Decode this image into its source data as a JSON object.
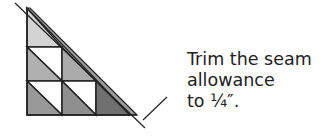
{
  "diagram": {
    "caption_lines": [
      "Trim the seam",
      "allowance",
      "to ¼″."
    ],
    "colors": {
      "stroke": "#222222",
      "light_gray": "#cfcfcf",
      "mid_gray": "#a8a8a8",
      "dark_gray": "#8a8a8a",
      "darker_gray": "#6e6e6e",
      "white": "#ffffff"
    }
  }
}
